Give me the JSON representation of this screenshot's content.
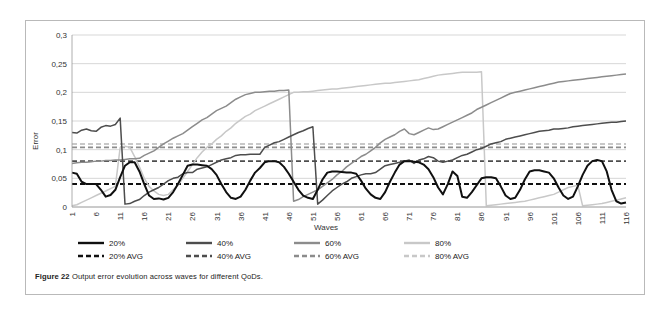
{
  "figure": {
    "caption_bold": "Figure 22",
    "caption_rest": " Output error evolution across waves for different QoDs."
  },
  "chart_data": {
    "type": "line",
    "title": "",
    "xlabel": "Waves",
    "ylabel": "Error",
    "ylim": [
      0,
      0.3
    ],
    "xlim": [
      1,
      116
    ],
    "grid": true,
    "legend_position": "bottom",
    "decimal_separator": ",",
    "ytick_labels": [
      "0",
      "0,05",
      "0,1",
      "0,15",
      "0,2",
      "0,25",
      "0,3"
    ],
    "ytick_values": [
      0,
      0.05,
      0.1,
      0.15,
      0.2,
      0.25,
      0.3
    ],
    "xtick_labels": [
      "1",
      "6",
      "11",
      "16",
      "21",
      "26",
      "31",
      "36",
      "41",
      "46",
      "51",
      "56",
      "61",
      "66",
      "71",
      "76",
      "81",
      "86",
      "91",
      "96",
      "101",
      "106",
      "111",
      "116"
    ],
    "xtick_values": [
      1,
      6,
      11,
      16,
      21,
      26,
      31,
      36,
      41,
      46,
      51,
      56,
      61,
      66,
      71,
      76,
      81,
      86,
      91,
      96,
      101,
      106,
      111,
      116
    ],
    "colors": {
      "s20": "#101010",
      "s40": "#4d4d4d",
      "s60": "#8c8c8c",
      "s80": "#c8c8c8"
    },
    "series": [
      {
        "name": "20%",
        "key": "s20",
        "style": "solid",
        "color": "#101010",
        "x": [
          1,
          2,
          3,
          4,
          5,
          6,
          7,
          8,
          9,
          10,
          11,
          12,
          13,
          14,
          15,
          16,
          17,
          18,
          19,
          20,
          21,
          22,
          23,
          24,
          25,
          26,
          27,
          28,
          29,
          30,
          31,
          32,
          33,
          34,
          35,
          36,
          37,
          38,
          39,
          40,
          41,
          42,
          43,
          44,
          45,
          46,
          47,
          48,
          49,
          50,
          51,
          52,
          53,
          54,
          55,
          56,
          57,
          58,
          59,
          60,
          61,
          62,
          63,
          64,
          65,
          66,
          67,
          68,
          69,
          70,
          71,
          72,
          73,
          74,
          75,
          76,
          77,
          78,
          79,
          80,
          81,
          82,
          83,
          84,
          85,
          86,
          87,
          88,
          89,
          90,
          91,
          92,
          93,
          94,
          95,
          96,
          97,
          98,
          99,
          100,
          101,
          102,
          103,
          104,
          105,
          106,
          107,
          108,
          109,
          110,
          111,
          112,
          113,
          114,
          115,
          116
        ],
        "values": [
          0.06,
          0.058,
          0.044,
          0.04,
          0.04,
          0.04,
          0.03,
          0.018,
          0.021,
          0.03,
          0.052,
          0.072,
          0.078,
          0.078,
          0.062,
          0.04,
          0.02,
          0.014,
          0.015,
          0.013,
          0.016,
          0.026,
          0.04,
          0.056,
          0.072,
          0.074,
          0.074,
          0.073,
          0.072,
          0.066,
          0.056,
          0.04,
          0.026,
          0.016,
          0.014,
          0.018,
          0.03,
          0.046,
          0.06,
          0.068,
          0.078,
          0.08,
          0.08,
          0.078,
          0.07,
          0.058,
          0.044,
          0.03,
          0.02,
          0.016,
          0.014,
          0.03,
          0.048,
          0.06,
          0.062,
          0.062,
          0.061,
          0.06,
          0.06,
          0.058,
          0.046,
          0.032,
          0.022,
          0.016,
          0.014,
          0.026,
          0.044,
          0.06,
          0.074,
          0.08,
          0.08,
          0.079,
          0.078,
          0.074,
          0.066,
          0.052,
          0.034,
          0.022,
          0.04,
          0.062,
          0.054,
          0.018,
          0.016,
          0.026,
          0.038,
          0.05,
          0.052,
          0.052,
          0.05,
          0.036,
          0.02,
          0.014,
          0.016,
          0.03,
          0.048,
          0.062,
          0.064,
          0.064,
          0.062,
          0.06,
          0.05,
          0.034,
          0.02,
          0.014,
          0.018,
          0.036,
          0.056,
          0.072,
          0.08,
          0.082,
          0.08,
          0.062,
          0.03,
          0.01,
          0.006,
          0.008
        ]
      },
      {
        "name": "40%",
        "key": "s40",
        "style": "solid",
        "color": "#4d4d4d",
        "x": [
          1,
          2,
          3,
          4,
          5,
          6,
          7,
          8,
          9,
          10,
          11,
          12,
          13,
          14,
          15,
          16,
          17,
          18,
          19,
          20,
          21,
          22,
          23,
          24,
          25,
          26,
          27,
          28,
          29,
          30,
          31,
          32,
          33,
          34,
          35,
          36,
          37,
          38,
          39,
          40,
          41,
          42,
          43,
          44,
          45,
          46,
          47,
          48,
          49,
          50,
          51,
          52,
          53,
          54,
          55,
          56,
          57,
          58,
          59,
          60,
          61,
          62,
          63,
          64,
          65,
          66,
          67,
          68,
          69,
          70,
          71,
          72,
          73,
          74,
          75,
          76,
          77,
          78,
          79,
          80,
          81,
          82,
          83,
          84,
          85,
          86,
          87,
          88,
          89,
          90,
          91,
          92,
          93,
          94,
          95,
          96,
          97,
          98,
          99,
          100,
          101,
          102,
          103,
          104,
          105,
          106,
          107,
          108,
          109,
          110,
          111,
          112,
          113,
          114,
          115,
          116
        ],
        "values": [
          0.13,
          0.129,
          0.134,
          0.136,
          0.133,
          0.132,
          0.139,
          0.142,
          0.141,
          0.144,
          0.155,
          0.005,
          0.006,
          0.01,
          0.013,
          0.02,
          0.026,
          0.03,
          0.034,
          0.04,
          0.046,
          0.05,
          0.052,
          0.058,
          0.06,
          0.06,
          0.066,
          0.068,
          0.07,
          0.074,
          0.078,
          0.082,
          0.084,
          0.086,
          0.09,
          0.091,
          0.091,
          0.092,
          0.092,
          0.092,
          0.104,
          0.108,
          0.112,
          0.114,
          0.118,
          0.122,
          0.126,
          0.13,
          0.133,
          0.137,
          0.14,
          0.005,
          0.012,
          0.02,
          0.028,
          0.034,
          0.04,
          0.044,
          0.05,
          0.053,
          0.056,
          0.058,
          0.058,
          0.06,
          0.066,
          0.072,
          0.074,
          0.076,
          0.078,
          0.08,
          0.082,
          0.076,
          0.082,
          0.084,
          0.088,
          0.086,
          0.08,
          0.078,
          0.08,
          0.082,
          0.086,
          0.09,
          0.092,
          0.096,
          0.1,
          0.102,
          0.106,
          0.11,
          0.112,
          0.114,
          0.118,
          0.12,
          0.122,
          0.124,
          0.126,
          0.128,
          0.13,
          0.132,
          0.133,
          0.134,
          0.136,
          0.136,
          0.137,
          0.138,
          0.14,
          0.141,
          0.142,
          0.143,
          0.144,
          0.145,
          0.146,
          0.147,
          0.148,
          0.148,
          0.149,
          0.15
        ]
      },
      {
        "name": "60%",
        "key": "s60",
        "style": "solid",
        "color": "#8c8c8c",
        "x": [
          1,
          2,
          3,
          4,
          5,
          6,
          7,
          8,
          9,
          10,
          11,
          12,
          13,
          14,
          15,
          16,
          17,
          18,
          19,
          20,
          21,
          22,
          23,
          24,
          25,
          26,
          27,
          28,
          29,
          30,
          31,
          32,
          33,
          34,
          35,
          36,
          37,
          38,
          39,
          40,
          41,
          42,
          43,
          44,
          45,
          46,
          47,
          48,
          49,
          50,
          51,
          52,
          53,
          54,
          55,
          56,
          57,
          58,
          59,
          60,
          61,
          62,
          63,
          64,
          65,
          66,
          67,
          68,
          69,
          70,
          71,
          72,
          73,
          74,
          75,
          76,
          77,
          78,
          79,
          80,
          81,
          82,
          83,
          84,
          85,
          86,
          87,
          88,
          89,
          90,
          91,
          92,
          93,
          94,
          95,
          96,
          97,
          98,
          99,
          100,
          101,
          102,
          103,
          104,
          105,
          106,
          107,
          108,
          109,
          110,
          111,
          112,
          113,
          114,
          115,
          116
        ],
        "values": [
          0.076,
          0.077,
          0.078,
          0.078,
          0.079,
          0.08,
          0.08,
          0.081,
          0.081,
          0.082,
          0.082,
          0.083,
          0.084,
          0.084,
          0.085,
          0.09,
          0.094,
          0.098,
          0.104,
          0.11,
          0.115,
          0.12,
          0.124,
          0.128,
          0.134,
          0.14,
          0.146,
          0.152,
          0.156,
          0.162,
          0.168,
          0.172,
          0.176,
          0.182,
          0.188,
          0.192,
          0.196,
          0.198,
          0.2,
          0.2,
          0.201,
          0.202,
          0.202,
          0.203,
          0.203,
          0.204,
          0.01,
          0.013,
          0.018,
          0.022,
          0.026,
          0.03,
          0.036,
          0.042,
          0.048,
          0.056,
          0.062,
          0.07,
          0.076,
          0.082,
          0.088,
          0.092,
          0.098,
          0.104,
          0.112,
          0.118,
          0.122,
          0.126,
          0.132,
          0.136,
          0.128,
          0.126,
          0.13,
          0.134,
          0.138,
          0.135,
          0.136,
          0.14,
          0.144,
          0.148,
          0.152,
          0.156,
          0.16,
          0.164,
          0.17,
          0.174,
          0.178,
          0.182,
          0.186,
          0.19,
          0.194,
          0.198,
          0.2,
          0.202,
          0.204,
          0.206,
          0.208,
          0.21,
          0.212,
          0.214,
          0.216,
          0.218,
          0.219,
          0.22,
          0.221,
          0.222,
          0.223,
          0.224,
          0.225,
          0.226,
          0.227,
          0.228,
          0.229,
          0.23,
          0.231,
          0.232
        ]
      },
      {
        "name": "80%",
        "key": "s80",
        "style": "solid",
        "color": "#c8c8c8",
        "x": [
          1,
          2,
          3,
          4,
          5,
          6,
          7,
          8,
          9,
          10,
          11,
          12,
          13,
          14,
          15,
          16,
          17,
          18,
          19,
          20,
          21,
          22,
          23,
          24,
          25,
          26,
          27,
          28,
          29,
          30,
          31,
          32,
          33,
          34,
          35,
          36,
          37,
          38,
          39,
          40,
          41,
          42,
          43,
          44,
          45,
          46,
          47,
          48,
          49,
          50,
          51,
          52,
          53,
          54,
          55,
          56,
          57,
          58,
          59,
          60,
          61,
          62,
          63,
          64,
          65,
          66,
          67,
          68,
          69,
          70,
          71,
          72,
          73,
          74,
          75,
          76,
          77,
          78,
          79,
          80,
          81,
          82,
          83,
          84,
          85,
          86,
          87,
          88,
          89,
          90,
          91,
          92,
          93,
          94,
          95,
          96,
          97,
          98,
          99,
          100,
          101,
          102,
          103,
          104,
          105,
          106,
          107,
          108,
          109,
          110,
          111,
          112,
          113,
          114,
          115,
          116
        ],
        "values": [
          0.002,
          0.004,
          0.008,
          0.012,
          0.016,
          0.02,
          0.024,
          0.028,
          0.032,
          0.036,
          0.104,
          0.106,
          0.104,
          0.088,
          0.07,
          0.05,
          0.036,
          0.028,
          0.022,
          0.02,
          0.022,
          0.03,
          0.038,
          0.05,
          0.062,
          0.074,
          0.086,
          0.096,
          0.104,
          0.11,
          0.118,
          0.124,
          0.132,
          0.138,
          0.146,
          0.152,
          0.158,
          0.162,
          0.168,
          0.172,
          0.176,
          0.18,
          0.184,
          0.188,
          0.192,
          0.196,
          0.2,
          0.2,
          0.201,
          0.201,
          0.202,
          0.203,
          0.204,
          0.205,
          0.206,
          0.206,
          0.207,
          0.208,
          0.209,
          0.21,
          0.211,
          0.212,
          0.213,
          0.214,
          0.215,
          0.216,
          0.216,
          0.217,
          0.218,
          0.219,
          0.22,
          0.221,
          0.222,
          0.224,
          0.226,
          0.228,
          0.23,
          0.231,
          0.232,
          0.233,
          0.234,
          0.235,
          0.235,
          0.235,
          0.235,
          0.236,
          0.002,
          0.003,
          0.004,
          0.005,
          0.006,
          0.007,
          0.008,
          0.009,
          0.01,
          0.012,
          0.014,
          0.016,
          0.018,
          0.02,
          0.022,
          0.026,
          0.03,
          0.034,
          0.036,
          0.038,
          0.002,
          0.003,
          0.004,
          0.005,
          0.006,
          0.008,
          0.01,
          0.012,
          0.014,
          0.016
        ]
      }
    ],
    "average_lines": [
      {
        "name": "20% AVG",
        "key": "avg20",
        "value": 0.04,
        "color": "#101010",
        "style": "dashed"
      },
      {
        "name": "40% AVG",
        "key": "avg40",
        "value": 0.08,
        "color": "#4d4d4d",
        "style": "dashed"
      },
      {
        "name": "60% AVG",
        "key": "avg60",
        "value": 0.104,
        "color": "#8c8c8c",
        "style": "dashed"
      },
      {
        "name": "80% AVG",
        "key": "avg80",
        "value": 0.11,
        "color": "#c8c8c8",
        "style": "dashed"
      }
    ],
    "legend": [
      {
        "label": "20%",
        "color": "#101010",
        "style": "solid"
      },
      {
        "label": "40%",
        "color": "#4d4d4d",
        "style": "solid"
      },
      {
        "label": "60%",
        "color": "#8c8c8c",
        "style": "solid"
      },
      {
        "label": "80%",
        "color": "#c8c8c8",
        "style": "solid"
      },
      {
        "label": "20% AVG",
        "color": "#101010",
        "style": "dashed"
      },
      {
        "label": "40% AVG",
        "color": "#4d4d4d",
        "style": "dashed"
      },
      {
        "label": "60% AVG",
        "color": "#8c8c8c",
        "style": "dashed"
      },
      {
        "label": "80% AVG",
        "color": "#c8c8c8",
        "style": "dashed"
      }
    ]
  }
}
